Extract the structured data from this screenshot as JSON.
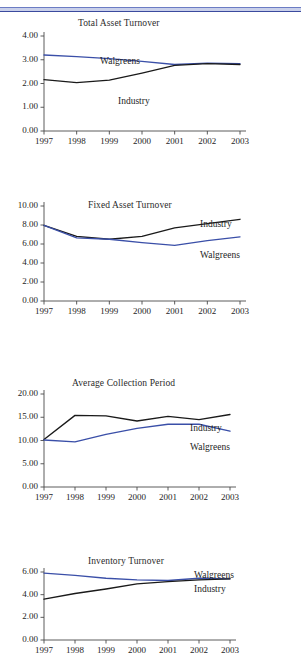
{
  "page": {
    "rule_color": "#3b4a9e",
    "series_colors": {
      "walgreens": "#3a4fa8",
      "industry": "#1a1a1a"
    }
  },
  "charts": [
    {
      "title": "Total Asset Turnover",
      "ylabels": [
        "4.00",
        "3.00",
        "2.00",
        "1.00",
        "0.00"
      ],
      "xlabels": [
        "1997",
        "1998",
        "1999",
        "2000",
        "2001",
        "2002",
        "2003"
      ],
      "label_walgreens": "Walgreens",
      "label_industry": "Industry"
    },
    {
      "title": "Fixed Asset Turnover",
      "ylabels": [
        "10.00",
        "8.00",
        "6.00",
        "4.00",
        "2.00",
        "0.00"
      ],
      "xlabels": [
        "1997",
        "1998",
        "1999",
        "2000",
        "2001",
        "2002",
        "2003"
      ],
      "label_walgreens": "Walgreens",
      "label_industry": "Industry"
    },
    {
      "title": "Average Collection Period",
      "ylabels": [
        "20.00",
        "15.00",
        "10.00",
        "5.00",
        "0.00"
      ],
      "xlabels": [
        "1997",
        "1998",
        "1999",
        "2000",
        "2001",
        "2002",
        "2003"
      ],
      "label_walgreens": "Walgreens",
      "label_industry": "Industry"
    },
    {
      "title": "Inventory Turnover",
      "ylabels": [
        "6.00",
        "4.00",
        "2.00",
        "0.00"
      ],
      "xlabels": [
        "1997",
        "1998",
        "1999",
        "2000",
        "2001",
        "2002",
        "2003"
      ],
      "label_walgreens": "Walgreens",
      "label_industry": "Industry"
    }
  ],
  "chart_data": [
    {
      "type": "line",
      "title": "Total Asset Turnover",
      "xlabel": "",
      "ylabel": "",
      "x": [
        1997,
        1998,
        1999,
        2000,
        2001,
        2002,
        2003
      ],
      "ylim": [
        0.0,
        4.0
      ],
      "yticks": [
        0.0,
        1.0,
        2.0,
        3.0,
        4.0
      ],
      "grid": false,
      "legend": "inline-annotations",
      "series": [
        {
          "name": "Walgreens",
          "color": "#3a4fa8",
          "values": [
            3.2,
            3.13,
            3.05,
            2.93,
            2.8,
            2.86,
            2.84
          ]
        },
        {
          "name": "Industry",
          "color": "#1a1a1a",
          "values": [
            2.16,
            2.04,
            2.14,
            2.44,
            2.76,
            2.84,
            2.8
          ]
        }
      ]
    },
    {
      "type": "line",
      "title": "Fixed Asset Turnover",
      "xlabel": "",
      "ylabel": "",
      "x": [
        1997,
        1998,
        1999,
        2000,
        2001,
        2002,
        2003
      ],
      "ylim": [
        0.0,
        10.0
      ],
      "yticks": [
        0.0,
        2.0,
        4.0,
        6.0,
        8.0,
        10.0
      ],
      "grid": false,
      "legend": "right-annotations",
      "series": [
        {
          "name": "Industry",
          "color": "#1a1a1a",
          "values": [
            7.95,
            6.8,
            6.5,
            6.8,
            7.7,
            8.15,
            8.6
          ]
        },
        {
          "name": "Walgreens",
          "color": "#3a4fa8",
          "values": [
            7.95,
            6.65,
            6.5,
            6.15,
            5.85,
            6.35,
            6.75
          ]
        }
      ]
    },
    {
      "type": "line",
      "title": "Average Collection Period",
      "xlabel": "",
      "ylabel": "",
      "x": [
        1997,
        1998,
        1999,
        2000,
        2001,
        2002,
        2003
      ],
      "ylim": [
        0.0,
        20.0
      ],
      "yticks": [
        0.0,
        5.0,
        10.0,
        15.0,
        20.0
      ],
      "grid": false,
      "legend": "right-annotations",
      "series": [
        {
          "name": "Industry",
          "color": "#1a1a1a",
          "values": [
            10.2,
            15.4,
            15.3,
            14.2,
            15.2,
            14.5,
            15.6
          ]
        },
        {
          "name": "Walgreens",
          "color": "#3a4fa8",
          "values": [
            10.1,
            9.7,
            11.3,
            12.6,
            13.5,
            13.5,
            12.0
          ]
        }
      ]
    },
    {
      "type": "line",
      "title": "Inventory Turnover",
      "xlabel": "",
      "ylabel": "",
      "x": [
        1997,
        1998,
        1999,
        2000,
        2001,
        2002,
        2003
      ],
      "ylim": [
        0.0,
        6.0
      ],
      "yticks": [
        0.0,
        2.0,
        4.0,
        6.0
      ],
      "grid": false,
      "legend": "top-right-stacked",
      "series": [
        {
          "name": "Walgreens",
          "color": "#3a4fa8",
          "values": [
            5.9,
            5.7,
            5.45,
            5.3,
            5.25,
            5.45,
            5.4
          ]
        },
        {
          "name": "Industry",
          "color": "#1a1a1a",
          "values": [
            3.6,
            4.1,
            4.5,
            4.95,
            5.15,
            5.3,
            5.4
          ]
        }
      ]
    }
  ]
}
